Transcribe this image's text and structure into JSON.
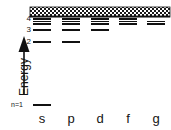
{
  "figure": {
    "type": "atomic-energy-level-diagram",
    "axis": {
      "label": "Energy",
      "direction": "up",
      "arrow": "up-arrow-icon"
    },
    "continuum_band": {
      "name": "continuum-band",
      "pattern": "stippled-hatched",
      "x": 30,
      "y": 7,
      "width": 140,
      "height": 10
    },
    "level_labels": [
      {
        "text": "4",
        "y": 18
      },
      {
        "text": "3",
        "y": 29
      },
      {
        "text": "2",
        "y": 41
      }
    ],
    "ground_label": {
      "text": "n=1",
      "y": 104
    },
    "columns": [
      {
        "label": "s",
        "x": 33,
        "width": 18
      },
      {
        "label": "p",
        "x": 62,
        "width": 18
      },
      {
        "label": "d",
        "x": 91,
        "width": 18
      },
      {
        "label": "f",
        "x": 119,
        "width": 18
      },
      {
        "label": "g",
        "x": 147,
        "width": 18
      }
    ],
    "levels": {
      "s": [
        {
          "n": 4,
          "y": 18
        },
        {
          "n": 5,
          "y": 20.5
        },
        {
          "n": 6,
          "y": 23
        },
        {
          "n": 3,
          "y": 29
        },
        {
          "n": 2,
          "y": 41
        },
        {
          "n": 1,
          "y": 104
        }
      ],
      "p": [
        {
          "n": 4,
          "y": 18
        },
        {
          "n": 5,
          "y": 20.5
        },
        {
          "n": 6,
          "y": 23
        },
        {
          "n": 3,
          "y": 29
        },
        {
          "n": 2,
          "y": 41
        }
      ],
      "d": [
        {
          "n": 4,
          "y": 18
        },
        {
          "n": 5,
          "y": 20.5
        },
        {
          "n": 6,
          "y": 23
        },
        {
          "n": 3,
          "y": 29
        }
      ],
      "f": [
        {
          "n": 4,
          "y": 18
        },
        {
          "n": 5,
          "y": 20.5
        },
        {
          "n": 6,
          "y": 23
        }
      ],
      "g": [
        {
          "n": 5,
          "y": 20.5
        },
        {
          "n": 6,
          "y": 23
        }
      ]
    },
    "colors": {
      "ink": "#111111",
      "background": "#ffffff"
    }
  }
}
